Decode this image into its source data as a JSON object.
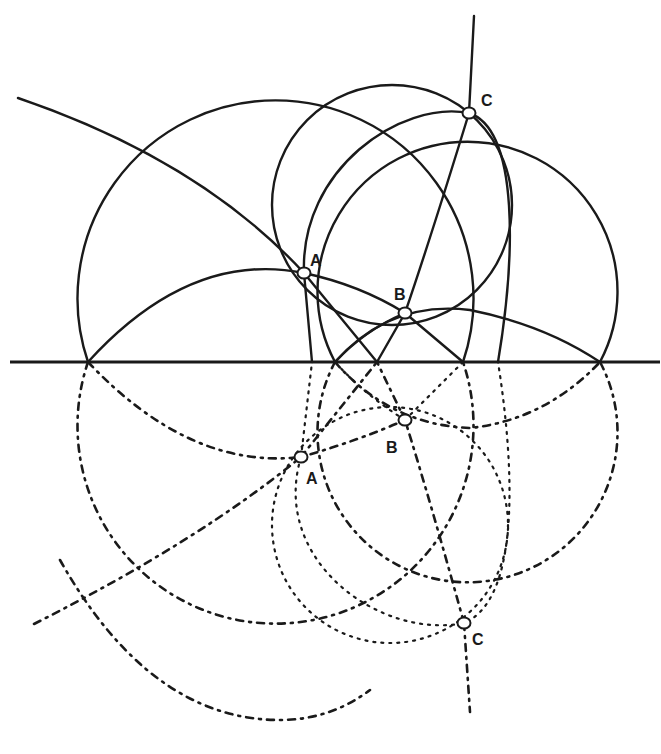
{
  "diagram": {
    "colors": {
      "ink": "#1a1a1a",
      "background": "#ffffff"
    },
    "mirror_line": {
      "y": 362,
      "x1": 10,
      "x2": 660
    },
    "upper_points": [
      {
        "label": "A",
        "x": 304,
        "y": 273,
        "lx": 310,
        "ly": 266
      },
      {
        "label": "B",
        "x": 405,
        "y": 313,
        "lx": 394,
        "ly": 300
      },
      {
        "label": "C",
        "x": 469,
        "y": 113,
        "lx": 481,
        "ly": 106
      }
    ],
    "lower_points": [
      {
        "label": "A",
        "x": 301,
        "y": 457,
        "lx": 306,
        "ly": 484
      },
      {
        "label": "B",
        "x": 405,
        "y": 420,
        "lx": 386,
        "ly": 453
      },
      {
        "label": "C",
        "x": 464,
        "y": 623,
        "lx": 472,
        "ly": 645
      }
    ]
  }
}
